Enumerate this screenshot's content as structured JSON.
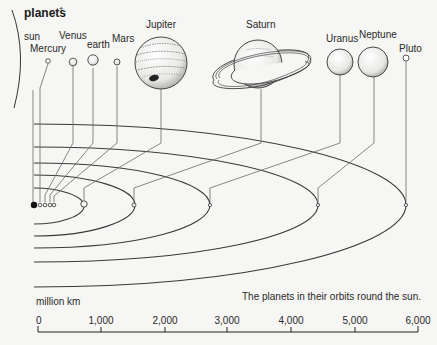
{
  "title": "planets",
  "title_mark": "†",
  "caption": "The planets in their orbits round the sun.",
  "scale": {
    "unit_label": "million km",
    "ticks": [
      "0",
      "1,000",
      "2,000",
      "3,000",
      "4,000",
      "5,000",
      "6,000"
    ]
  },
  "bodies": [
    {
      "name": "sun"
    },
    {
      "name": "Mercury"
    },
    {
      "name": "Venus"
    },
    {
      "name": "earth"
    },
    {
      "name": "Mars"
    },
    {
      "name": "Jupiter"
    },
    {
      "name": "Saturn"
    },
    {
      "name": "Uranus"
    },
    {
      "name": "Neptune"
    },
    {
      "name": "Pluto"
    }
  ],
  "colors": {
    "background": "#f6f6f4",
    "line": "#3a3a3a",
    "sun": "#111111"
  }
}
